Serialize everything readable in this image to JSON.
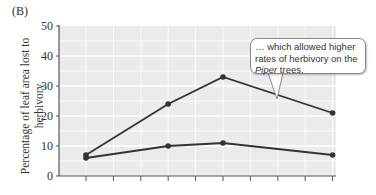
{
  "panel_label": "(B)",
  "callout": {
    "line1": "… which allowed higher",
    "line2": "rates of herbivory on the",
    "line3_italic": "Piper",
    "line3_rest": " trees."
  },
  "colors": {
    "plot_background": "#ebebeb",
    "gridlines": "#ffffff",
    "series_line": "#333333",
    "axis": "#555555"
  },
  "chart_data": {
    "type": "line",
    "title": "",
    "xlabel": "",
    "ylabel": "Percentage of leaf area lost to herbivory",
    "ylim": [
      0,
      50
    ],
    "yticks": [
      0,
      10,
      20,
      30,
      40,
      50
    ],
    "x_tick_count": 10,
    "grid": true,
    "legend": null,
    "x": [
      1,
      4,
      6,
      10
    ],
    "series": [
      {
        "name": "upper series",
        "values": [
          7,
          24,
          33,
          21
        ]
      },
      {
        "name": "lower series",
        "values": [
          6,
          10,
          11,
          7
        ]
      }
    ],
    "annotations": [
      "… which allowed higher rates of herbivory on the Piper trees."
    ]
  }
}
